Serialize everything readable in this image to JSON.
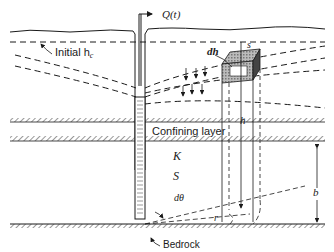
{
  "figure": {
    "labels": {
      "discharge": "Q(t)",
      "initial_head": "Initial h",
      "initial_head_sub": "c",
      "head_change": "dh",
      "distance_s": "s",
      "head": "h",
      "confining_layer": "Confining layer",
      "conductivity": "K",
      "storativity": "S",
      "angle": "dθ",
      "radius": "r",
      "thickness": "b",
      "bedrock": "Bedrock"
    },
    "colors": {
      "ink": "#1a1a1a",
      "background": "#ffffff",
      "shade": "#8a8a8a"
    }
  }
}
